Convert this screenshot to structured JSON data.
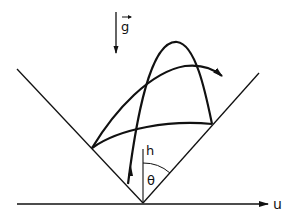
{
  "diagram": {
    "labels": {
      "gravity": "g",
      "height_axis": "h",
      "angle": "θ",
      "horizontal_axis": "u"
    },
    "elements": {
      "gravity_vector": "downward arrow",
      "wedge": "V-shaped boundary symmetric about vertical h axis, half-angle θ",
      "trajectories": [
        "tall parabolic arc launched from near wedge vertex, peaking high and landing on right wall",
        "arc from left wall to right wall",
        "arc from left wall exiting past right wall with arrowhead"
      ]
    },
    "colors": {
      "stroke": "#111111",
      "background": "#ffffff"
    }
  }
}
